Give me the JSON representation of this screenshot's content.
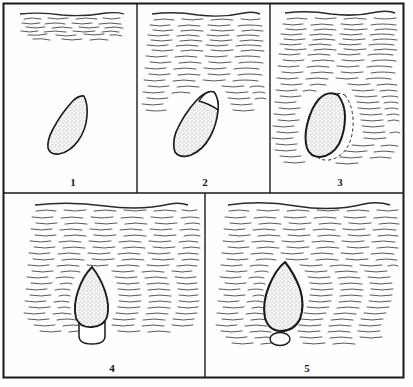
{
  "figure": {
    "caption_present": false,
    "panel_count": 5,
    "background_color": "#fefefe",
    "ink_color": "#1a1a1a",
    "stipple_color": "#9a9a9a",
    "frame": {
      "x": 3,
      "y": 3,
      "width": 401,
      "height": 375,
      "stroke_width": 2.0
    },
    "dividers": {
      "row": {
        "y": 193,
        "x_start": 3,
        "x_end": 404
      },
      "column_top_1": {
        "x": 137,
        "y_start": 3,
        "y_end": 193
      },
      "column_top_2": {
        "x": 270,
        "y_start": 3,
        "y_end": 193
      },
      "column_bottom_1": {
        "x": 205,
        "y_start": 193,
        "y_end": 378
      }
    }
  },
  "panels": [
    {
      "id": "panel-1",
      "number_label": "1",
      "number_x": 73,
      "number_y": 186,
      "bounds": {
        "x": 3,
        "y": 3,
        "width": 134,
        "height": 190
      },
      "hatch": {
        "name": "matrix-hatching",
        "band_top": 12,
        "band_bottom": 38,
        "density": "sparse",
        "top_surface_line": true,
        "description": "narrow band of horizontal wavy hatch lines at the top of the panel"
      },
      "object": {
        "name": "stippled-body",
        "orientation_deg": 22,
        "fill": "stipple",
        "center_x": 68,
        "center_y": 125,
        "width": 34,
        "height": 58,
        "description": "tilted leaf/teardrop body, pointed at lower-left, fully stippled, no aperture"
      },
      "dashed_outline": false,
      "basal_cap": "none"
    },
    {
      "id": "panel-2",
      "number_label": "2",
      "number_x": 205,
      "number_y": 186,
      "bounds": {
        "x": 137,
        "y": 3,
        "width": 133,
        "height": 190
      },
      "hatch": {
        "name": "matrix-hatching",
        "band_top": 12,
        "band_bottom": 108,
        "density": "medium",
        "top_surface_line": true,
        "description": "hatched matrix extending roughly half-way down the panel, reaching the top of the body"
      },
      "object": {
        "name": "stippled-body",
        "orientation_deg": 20,
        "fill": "stipple",
        "center_x": 198,
        "center_y": 125,
        "width": 36,
        "height": 60,
        "description": "tilted body with a blank (unstippled) wedge at the upper-right apex"
      },
      "blank_apex": true,
      "dashed_outline": false,
      "basal_cap": "none"
    },
    {
      "id": "panel-3",
      "number_label": "3",
      "number_x": 340,
      "number_y": 186,
      "bounds": {
        "x": 270,
        "y": 3,
        "width": 134,
        "height": 190
      },
      "hatch": {
        "name": "matrix-hatching",
        "band_top": 12,
        "band_bottom": 165,
        "density": "dense",
        "top_surface_line": true,
        "description": "dense hatched matrix filling most of the panel, surrounding the body"
      },
      "object": {
        "name": "stippled-body",
        "orientation_deg": 12,
        "fill": "stipple",
        "center_x": 329,
        "center_y": 125,
        "width": 36,
        "height": 60,
        "description": "near-upright body with a heavy outline"
      },
      "dashed_outline": true,
      "dashed_outline_note": "dashed line traced around the right and lower margin of the body indicating the displaced or former boundary",
      "basal_cap": "none"
    },
    {
      "id": "panel-4",
      "number_label": "4",
      "number_x": 112,
      "number_y": 372,
      "bounds": {
        "x": 3,
        "y": 193,
        "width": 202,
        "height": 185
      },
      "hatch": {
        "name": "matrix-hatching",
        "band_top": 203,
        "band_bottom": 330,
        "density": "dense",
        "top_surface_line": true,
        "description": "dense hatched matrix across the upper two-thirds of the wide panel"
      },
      "object": {
        "name": "stippled-body",
        "orientation_deg": 0,
        "fill": "stipple",
        "center_x": 92,
        "center_y": 298,
        "width": 32,
        "height": 62,
        "description": "upright spindle / rhomboid body, stippled, apex at top"
      },
      "dashed_outline": false,
      "basal_cap": "attached",
      "basal_cap_note": "blank rounded cup attached directly to the base of the body"
    },
    {
      "id": "panel-5",
      "number_label": "5",
      "number_x": 307,
      "number_y": 372,
      "bounds": {
        "x": 205,
        "y": 193,
        "width": 199,
        "height": 185
      },
      "hatch": {
        "name": "matrix-hatching",
        "band_top": 203,
        "band_bottom": 345,
        "density": "dense",
        "top_surface_line": true,
        "description": "dense hatched matrix filling nearly the whole wide panel"
      },
      "object": {
        "name": "stippled-body",
        "orientation_deg": 0,
        "fill": "stipple",
        "center_x": 284,
        "center_y": 297,
        "width": 38,
        "height": 70,
        "description": "large upright rhomboid body, stippled, widest near mid-height"
      },
      "dashed_outline": false,
      "basal_cap": "detached",
      "basal_cap_note": "small blank oval separated from and lying just below the base of the body"
    }
  ],
  "legend": {
    "present": false
  }
}
